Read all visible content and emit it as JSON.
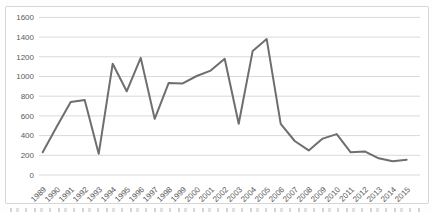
{
  "chart_data": {
    "type": "line",
    "title": "",
    "xlabel": "",
    "ylabel": "",
    "categories": [
      "1989",
      "1990",
      "1991",
      "1992",
      "1993",
      "1994",
      "1995",
      "1996",
      "1997",
      "1998",
      "1999",
      "2000",
      "2001",
      "2002",
      "2003",
      "2004",
      "2005",
      "2006",
      "2007",
      "2008",
      "2009",
      "2010",
      "2011",
      "2012",
      "2013",
      "2014",
      "2015"
    ],
    "series": [
      {
        "name": "",
        "values": [
          230,
          490,
          740,
          760,
          215,
          1130,
          850,
          1190,
          570,
          935,
          930,
          1005,
          1060,
          1180,
          520,
          1260,
          1380,
          520,
          345,
          250,
          370,
          415,
          230,
          240,
          170,
          140,
          155
        ]
      }
    ],
    "ylim": [
      0,
      1600
    ],
    "ytick_values": [
      0,
      200,
      400,
      600,
      800,
      1000,
      1200,
      1400,
      1600
    ],
    "yticks": [
      "0",
      "200",
      "400",
      "600",
      "800",
      "1000",
      "1200",
      "1400",
      "1600"
    ],
    "grid": "horizontal",
    "legend": "none",
    "markers": "none",
    "x_tick_rotation_deg": 45,
    "colors": {
      "line": "#6e6e6e",
      "gridline": "#d9d9d9",
      "tick_text": "#595959",
      "frame_border": "#d6d6d6",
      "background": "#ffffff"
    }
  }
}
